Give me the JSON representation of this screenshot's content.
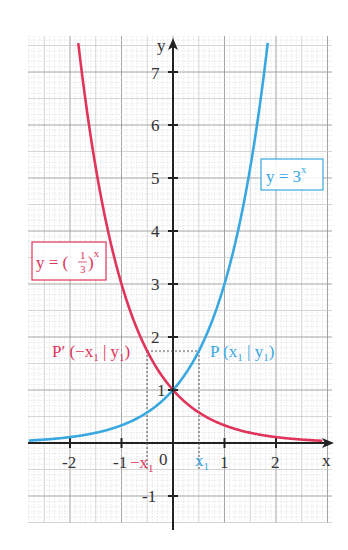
{
  "chart_data": {
    "type": "line",
    "title": "",
    "xlabel": "x",
    "ylabel": "y",
    "xlim": [
      -2.8,
      3.1
    ],
    "ylim": [
      -1.5,
      7.7
    ],
    "grid": true,
    "x_ticks": [
      "-2",
      "-1",
      "0",
      "1",
      "2"
    ],
    "y_ticks": [
      "-1",
      "1",
      "2",
      "3",
      "4",
      "5",
      "6",
      "7"
    ],
    "origin_label": "0",
    "series": [
      {
        "name": "y = 3^x",
        "label_text": "y = 3",
        "label_exp": "x",
        "color": "#3aa8e0",
        "x": [
          -2.8,
          -2,
          -1,
          -0.5,
          0,
          0.5,
          1,
          1.5,
          1.8,
          1.9
        ],
        "values": [
          0.046,
          0.111,
          0.333,
          0.577,
          1,
          1.732,
          3,
          5.196,
          7.225,
          8.06
        ]
      },
      {
        "name": "y = (1/3)^x",
        "label_text": "y = (",
        "label_frac_num": "1",
        "label_frac_den": "3",
        "label_close": ")",
        "label_exp": "x",
        "color": "#e0345a",
        "x": [
          -1.9,
          -1.8,
          -1.5,
          -1,
          -0.5,
          0,
          0.5,
          1,
          2,
          2.8
        ],
        "values": [
          8.06,
          7.225,
          5.196,
          3,
          1.732,
          1,
          0.577,
          0.333,
          0.111,
          0.046
        ]
      }
    ],
    "annotations": [
      {
        "text": "P(x₁ | y₁)",
        "x": 0.5,
        "y": 1.732,
        "color": "#3aa8e0"
      },
      {
        "text": "P′(−x₁ | y₁)",
        "x": -0.5,
        "y": 1.732,
        "color": "#e0345a"
      },
      {
        "text": "x₁",
        "x": 0.5,
        "on_axis": "x",
        "color": "#3aa8e0"
      },
      {
        "text": "−x₁",
        "x": -0.5,
        "on_axis": "x",
        "color": "#e0345a"
      }
    ],
    "legend_position": "inline boxes"
  },
  "labels": {
    "x_axis": "x",
    "y_axis": "y",
    "origin": "0",
    "blue_box": "y = 3",
    "blue_box_exp": "x",
    "red_box_pre": "y = (",
    "red_box_num": "1",
    "red_box_den": "3",
    "red_box_post": ")",
    "red_box_exp": "x",
    "p_label": "P (x",
    "p_sub": "1",
    "p_mid": " | y",
    "p_sub2": "1",
    "p_end": ")",
    "pp_label": "P′ (−x",
    "pp_sub": "1",
    "pp_mid": " | y",
    "pp_sub2": "1",
    "pp_end": ")",
    "x1": "x",
    "x1_sub": "1",
    "negx1": "−x",
    "negx1_sub": "1"
  }
}
